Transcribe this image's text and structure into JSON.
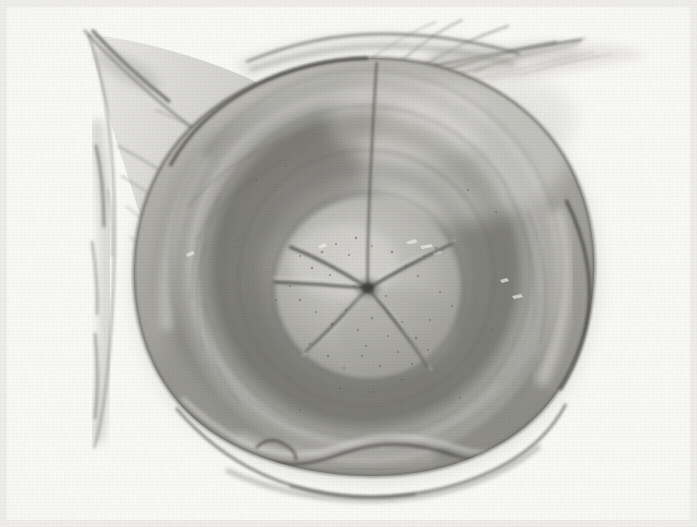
{
  "figure": {
    "kind": "anatomical-illustration",
    "medium": "graphite and wash drawing on textured paper",
    "palette": {
      "paper": "#fbfbf9",
      "paper_shadow": "#ededea",
      "tissue_light": "#c9c8c4",
      "tissue_mid": "#a6a5a0",
      "tissue_dark": "#8a8984",
      "tissue_deep": "#74736e",
      "outline": "#4a4a46",
      "fissure": "#3a3a36",
      "highlight": "#e8e7e3"
    },
    "canvas": {
      "width": 697,
      "height": 527
    },
    "subject": {
      "name": "cervix with stellate external os",
      "center": {
        "x": 368,
        "y": 288
      }
    },
    "parts": [
      {
        "id": "vaginal-wall-left",
        "label": "retracted vaginal wall, left"
      },
      {
        "id": "vaginal-wall-right",
        "label": "retracted vaginal wall, right"
      },
      {
        "id": "fornix-ring-outer",
        "label": "outer fornix ring"
      },
      {
        "id": "fornix-ring-mid",
        "label": "middle fornix ring"
      },
      {
        "id": "fornix-ring-inner",
        "label": "inner fornix ring"
      },
      {
        "id": "portio-vaginalis",
        "label": "portio vaginalis"
      },
      {
        "id": "external-os",
        "label": "stellate external os"
      },
      {
        "id": "median-fissure",
        "label": "median anterior fissure"
      },
      {
        "id": "posterior-lip-fold",
        "label": "posterior lip fold"
      }
    ],
    "body_outline": {
      "comment": "main rounded tissue mass, slightly irregular circle",
      "path": "M 368 58 C 452 56 532 96 570 166 C 604 230 602 312 566 378 C 528 446 448 478 366 476 C 282 474 204 444 166 386 C 126 326 124 240 156 176 C 190 106 276 60 368 58 Z"
    },
    "rings": [
      {
        "id": "fornix-ring-outer",
        "cx": 366,
        "cy": 268,
        "rx": 196,
        "ry": 198,
        "rot": -4,
        "stroke": "#6e6d68",
        "width": 2.0,
        "opacity": 0.62
      },
      {
        "id": "fornix-ring-mid",
        "cx": 366,
        "cy": 272,
        "rx": 164,
        "ry": 166,
        "rot": -6,
        "stroke": "#6a6964",
        "width": 2.4,
        "opacity": 0.55
      },
      {
        "id": "fornix-ring-inner",
        "cx": 366,
        "cy": 278,
        "rx": 128,
        "ry": 128,
        "rot": -8,
        "stroke": "#63625d",
        "width": 2.6,
        "opacity": 0.5
      },
      {
        "id": "portio-rim",
        "cx": 368,
        "cy": 286,
        "rx": 96,
        "ry": 94,
        "rot": -6,
        "stroke": "#5e5d58",
        "width": 2.2,
        "opacity": 0.44
      }
    ],
    "os_rays": {
      "center": {
        "x": 368,
        "y": 288
      },
      "count": 5,
      "rays": [
        {
          "id": "ray-upper-left",
          "end": {
            "x": 290,
            "y": 247
          },
          "bend": {
            "x": 326,
            "y": 261
          }
        },
        {
          "id": "ray-upper-right",
          "end": {
            "x": 452,
            "y": 243
          },
          "bend": {
            "x": 414,
            "y": 262
          }
        },
        {
          "id": "ray-right",
          "end": {
            "x": 428,
            "y": 366
          },
          "bend": {
            "x": 404,
            "y": 330
          }
        },
        {
          "id": "ray-lower-left",
          "end": {
            "x": 306,
            "y": 352
          },
          "bend": {
            "x": 338,
            "y": 322
          }
        },
        {
          "id": "ray-left",
          "end": {
            "x": 275,
            "y": 282
          },
          "bend": {
            "x": 318,
            "y": 284
          }
        }
      ]
    },
    "median_fissure": {
      "id": "median-fissure",
      "path": "M 377 62 C 374 104 372 146 370 190 C 369 222 367 252 368 286"
    },
    "posterior_fold": {
      "id": "posterior-lip-fold",
      "path": "M 182 414 C 218 444 250 460 286 462 C 310 464 330 456 352 450 C 386 442 420 446 454 456 C 492 466 528 458 556 430"
    },
    "left_flap": {
      "id": "vaginal-wall-left",
      "path": "M 86 36 C 96 74 104 130 108 188 C 112 248 112 318 108 378 C 106 406 102 424 98 436"
    },
    "right_strands": {
      "id": "vaginal-wall-right",
      "count": 9
    },
    "speckles": {
      "count": 140,
      "note": "fine graphite stipple over the inner portio"
    },
    "grain": {
      "enabled": true,
      "note": "laid paper texture, horizontal fibres"
    }
  }
}
